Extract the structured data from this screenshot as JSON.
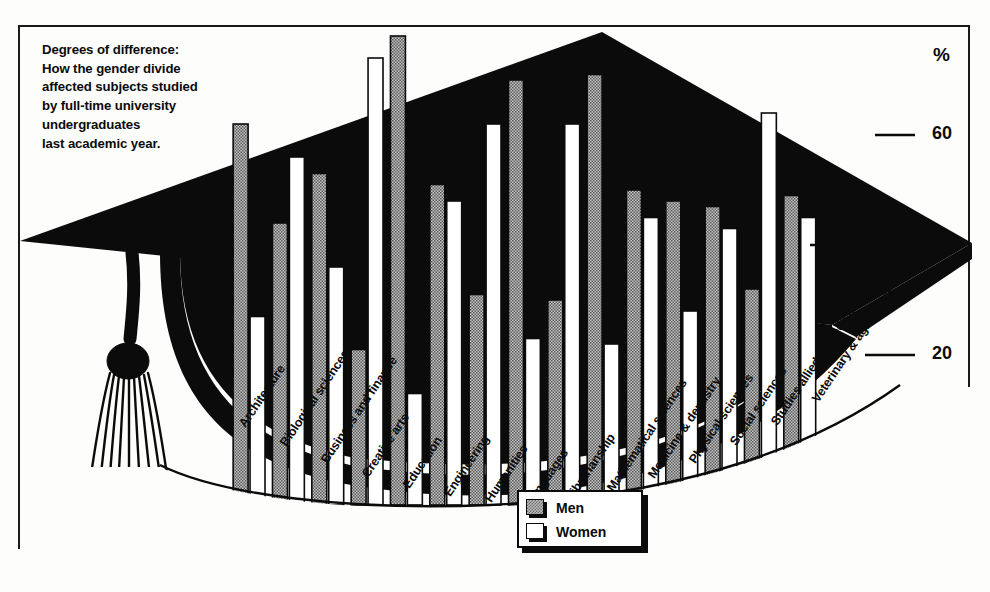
{
  "headline": {
    "lines": [
      "Degrees of difference:",
      "How the gender divide",
      "affected subjects studied",
      "by full-time university",
      "undergraduates",
      "last academic year."
    ]
  },
  "axis": {
    "unit_symbol": "%",
    "ticks": [
      "60",
      "40",
      "20"
    ]
  },
  "legend": {
    "items": [
      {
        "label": "Men",
        "swatch": "men-hatched"
      },
      {
        "label": "Women",
        "swatch": "women-white"
      }
    ]
  },
  "chart_data": {
    "type": "bar",
    "title": "Degrees of difference: How the gender divide affected subjects studied by full-time university undergraduates last academic year.",
    "xlabel": "",
    "ylabel": "%",
    "ylim": [
      0,
      80
    ],
    "yticks": [
      20,
      40,
      60
    ],
    "grid": false,
    "legend_position": "bottom-center",
    "categories": [
      "Architecture",
      "Biological sciences",
      "Business and finance",
      "Creative arts",
      "Education",
      "Engineering",
      "Humanities",
      "Languages",
      "Librarianship",
      "Mathematical sciences",
      "Medicine & dentistry",
      "Physical sciences",
      "Social sciences",
      "Studies allied to medicine",
      "Veterinary & agriculture"
    ],
    "series": [
      {
        "name": "Men",
        "color": "#b9b9b9",
        "values": [
          62,
          44,
          53,
          21,
          78,
          51,
          31,
          70,
          30,
          71,
          50,
          48,
          47,
          32,
          49
        ]
      },
      {
        "name": "Women",
        "color": "#ffffff",
        "values": [
          27,
          56,
          36,
          74,
          13,
          48,
          62,
          23,
          62,
          22,
          45,
          28,
          43,
          64,
          45
        ]
      }
    ]
  }
}
